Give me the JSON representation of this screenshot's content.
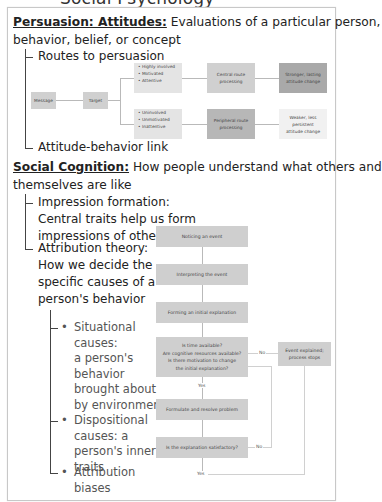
{
  "clipped_header": "Social Psychology",
  "persuasion": {
    "heading_bold": "Persuasion: Attitudes:",
    "heading_rest": " Evaluations of a particular person,",
    "heading_line2": "behavior, belief, or concept",
    "items": [
      "Routes to persuasion",
      "Attitude-behavior link"
    ],
    "diagram": {
      "message": "Message",
      "target": "Target",
      "high_group": [
        "• Highly involved",
        "• Motivated",
        "• Attentive"
      ],
      "low_group": [
        "• Uninvolved",
        "• Unmotivated",
        "• Inattentive"
      ],
      "central": [
        "Central route",
        "processing"
      ],
      "peripheral": [
        "Peripheral route",
        "processing"
      ],
      "strong": [
        "Stronger, lasting",
        "attitude change"
      ],
      "weak": [
        "Weaker, less",
        "persistent",
        "attitude change"
      ]
    }
  },
  "social_cognition": {
    "heading_bold": "Social Cognition:",
    "heading_rest": " How people understand what others and",
    "heading_line2": "themselves are like",
    "impression": [
      "Impression formation:",
      "Central traits help us form",
      "impressions of others"
    ],
    "attribution": [
      "Attribution theory:",
      "How we decide the",
      "specific causes of a",
      "person's behavior"
    ],
    "sub_items": [
      {
        "lines": [
          "Situational",
          "causes:",
          "a person's",
          "behavior",
          "brought about",
          "by environment"
        ]
      },
      {
        "lines": [
          "Dispositional",
          "causes: a",
          "person's inner",
          "traits"
        ]
      },
      {
        "lines": [
          "Attribution",
          "biases"
        ]
      }
    ],
    "flowchart": {
      "step1": "Noticing an event",
      "step2": "Interpreting the event",
      "step3": "Forming an initial explanation",
      "decision1": [
        "Is time available?",
        "Are cognitive resources available?",
        "Is there motivation to change",
        "the initial explanation?"
      ],
      "no1": "No",
      "yes1": "Yes",
      "end": [
        "Event explained;",
        "process stops"
      ],
      "step4": "Formulate and resolve problem",
      "decision2": "Is the explanation satisfactory?",
      "no2": "No",
      "yes2": "Yes"
    }
  }
}
